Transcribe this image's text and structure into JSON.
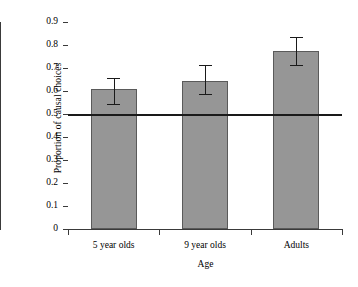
{
  "chart_data": {
    "type": "bar",
    "title": "",
    "xlabel": "Age",
    "ylabel": "Proportion of causal choices",
    "categories": [
      "5 year olds",
      "9 year olds",
      "Adults"
    ],
    "values": [
      0.61,
      0.645,
      0.775
    ],
    "errors_upper": [
      0.655,
      0.712,
      0.835
    ],
    "errors_lower": [
      0.545,
      0.588,
      0.713
    ],
    "ylim": [
      0,
      0.9
    ],
    "yticks": [
      0,
      0.1,
      0.2,
      0.3,
      0.4,
      0.5,
      0.6,
      0.7,
      0.8,
      0.9
    ],
    "ytick_labels": [
      "0",
      "0.1",
      "0.2",
      "0.3",
      "0.4",
      "0.5",
      "0.6",
      "0.7",
      "0.8",
      "0.9"
    ],
    "grid": false,
    "legend": null,
    "annotations": [
      {
        "type": "hline",
        "value": 0.5,
        "label": "chance level"
      }
    ],
    "colors": {
      "bar_fill": "#969696",
      "bar_stroke": "#5a5a5a",
      "axis": "#3a3a3a",
      "error_bar": "#1a1a1a",
      "reference_line": "#1a1a1a",
      "background": "#ffffff"
    }
  }
}
